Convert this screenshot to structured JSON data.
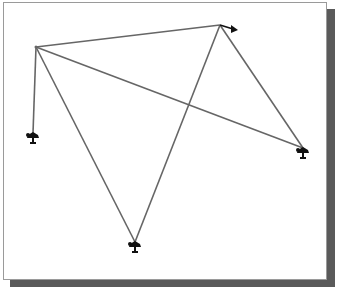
{
  "figure": {
    "background": "#ffffff",
    "border_color": "#9a9a9a",
    "shadow_color": "#5a5a5a",
    "line_color": "#666666",
    "marker_color": "#111111"
  },
  "nodes": [
    {
      "id": "A",
      "x": 36,
      "y": 47,
      "marker": "none"
    },
    {
      "id": "B",
      "x": 220,
      "y": 25,
      "marker": "arrow-right"
    },
    {
      "id": "C",
      "x": 303,
      "y": 148,
      "marker": "support"
    },
    {
      "id": "D",
      "x": 135,
      "y": 242,
      "marker": "support"
    },
    {
      "id": "E",
      "x": 33,
      "y": 133,
      "marker": "support"
    }
  ],
  "edges": [
    {
      "from": "A",
      "to": "B"
    },
    {
      "from": "A",
      "to": "E"
    },
    {
      "from": "A",
      "to": "C"
    },
    {
      "from": "A",
      "to": "D"
    },
    {
      "from": "B",
      "to": "D"
    },
    {
      "from": "B",
      "to": "C"
    }
  ]
}
